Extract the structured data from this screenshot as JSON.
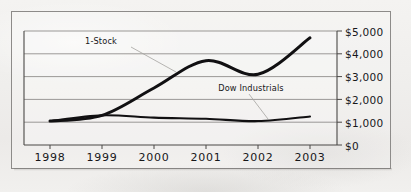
{
  "chart_data": {
    "type": "line",
    "title": "",
    "xlabel": "",
    "ylabel": "",
    "x": [
      1998,
      1999,
      2000,
      2001,
      2002,
      2003
    ],
    "categories": [
      "1998",
      "1999",
      "2000",
      "2001",
      "2002",
      "2003"
    ],
    "ylim": [
      0,
      5000
    ],
    "ytick_values": [
      5000,
      4000,
      3000,
      2000,
      1000,
      0
    ],
    "ytick_labels": [
      "$5,000",
      "$4,000",
      "$3,000",
      "$2,000",
      "$1,000",
      "$0"
    ],
    "grid": "horizontal",
    "legend": "inline-annotations",
    "series": [
      {
        "name": "1-Stock",
        "values": [
          1050,
          1300,
          2500,
          3700,
          3100,
          4700
        ],
        "color": "#111012",
        "label_text": "1-Stock"
      },
      {
        "name": "Dow Industrials",
        "values": [
          1050,
          1300,
          1200,
          1150,
          1050,
          1250
        ],
        "color": "#111012",
        "label_text": "Dow Industrials"
      }
    ],
    "annotations": [
      {
        "text": "1-Stock",
        "series": "1-Stock"
      },
      {
        "text": "Dow Industrials",
        "series": "Dow Industrials"
      }
    ]
  },
  "axes": {
    "y_labels": [
      "$5,000",
      "$4,000",
      "$3,000",
      "$2,000",
      "$1,000",
      "$0"
    ],
    "x_labels": [
      "1998",
      "1999",
      "2000",
      "2001",
      "2002",
      "2003"
    ]
  },
  "labels": {
    "stock": "1-Stock",
    "dow": "Dow Industrials"
  }
}
